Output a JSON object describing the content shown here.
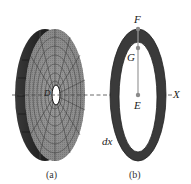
{
  "figure": {
    "panel_a": {
      "caption": "(a)",
      "center_label": "D",
      "description": "3D meshed disk (wheel) with central hole, viewed obliquely"
    },
    "panel_b": {
      "caption": "(b)",
      "labels": {
        "top_point": "F",
        "inner_point": "G",
        "center_point": "E",
        "axis": "X",
        "thickness": "dx"
      },
      "description": "Annular ring slice of thickness dx with radius line from E to F"
    },
    "colors": {
      "ring_fill": "#3a3a3a",
      "mesh_light": "#9a9a9a",
      "mesh_dark": "#2a2a2a",
      "point_marker": "#8a8a8a"
    }
  }
}
